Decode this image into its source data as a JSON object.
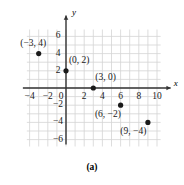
{
  "figure": {
    "caption": "(a)",
    "x_axis_name": "x",
    "y_axis_name": "y"
  },
  "chart_data": {
    "type": "scatter",
    "title": "",
    "xlabel": "x",
    "ylabel": "y",
    "xlim": [
      -5,
      11
    ],
    "ylim": [
      -7,
      7
    ],
    "grid": true,
    "grid_step": 1,
    "legend": "none",
    "xticks": [
      -4,
      -2,
      0,
      2,
      4,
      6,
      8,
      10
    ],
    "xtick_labels": [
      "−4",
      "−2",
      "0",
      "2",
      "4",
      "6",
      "8",
      "10"
    ],
    "yticks": [
      6,
      4,
      2,
      -2,
      -4,
      -6
    ],
    "ytick_labels": [
      "6",
      "4",
      "2",
      "−2",
      "−4",
      "−6"
    ],
    "points": [
      {
        "x": -3,
        "y": 4,
        "label": "(−3, 4)",
        "label_dx": -0.6,
        "label_dy": 1.15
      },
      {
        "x": 0,
        "y": 2,
        "label": "(0, 2)",
        "label_dx": 1.45,
        "label_dy": 1.15
      },
      {
        "x": 3,
        "y": 0,
        "label": "(3, 0)",
        "label_dx": 1.35,
        "label_dy": 1.2
      },
      {
        "x": 6,
        "y": -2,
        "label": "(6, −2)",
        "label_dx": -1.4,
        "label_dy": -1.15
      },
      {
        "x": 9,
        "y": -4,
        "label": "(9, −4)",
        "label_dx": -1.6,
        "label_dy": -1.15
      }
    ],
    "colors": {
      "grid": "#d4d4d4",
      "axis": "#333333",
      "point": "#1a1a1a",
      "text": "#1a1a1a"
    }
  }
}
